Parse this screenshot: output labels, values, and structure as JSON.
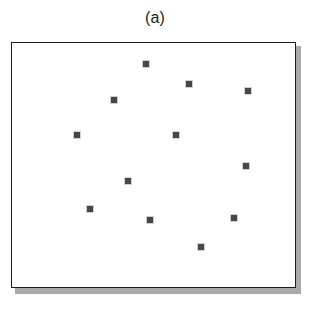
{
  "figure": {
    "caption": "(a)",
    "caption_name": "panel-label-a"
  },
  "colors": {
    "marker_fill": "#474747",
    "plot_border": "#1c1c1c",
    "plot_background": "#ffffff",
    "drop_shadow": "#a9a9a9",
    "caption_text": "#1b1b1b"
  },
  "plot": {
    "left": 11,
    "top": 42,
    "width": 285,
    "height": 246,
    "shadow_offset_x": 4,
    "shadow_offset_y": 4,
    "border_width": 1
  },
  "chart_data": {
    "type": "scatter",
    "title": "(a)",
    "xlabel": "",
    "ylabel": "",
    "grid": false,
    "legend": false,
    "marker": "filled-square",
    "marker_size_px": 6,
    "marker_color": "#474747",
    "n_points": 12,
    "axis_units": "pixels (image coordinates, origin at plot top-left)",
    "xlim": [
      0,
      285
    ],
    "ylim": [
      0,
      246
    ],
    "x": [
      134,
      102,
      177,
      236,
      65,
      164,
      234,
      116,
      78,
      138,
      222,
      189
    ],
    "y": [
      21,
      57,
      41,
      48,
      92,
      92,
      123,
      138,
      166,
      177,
      175,
      204
    ],
    "points": [
      {
        "x": 134,
        "y": 21
      },
      {
        "x": 102,
        "y": 57
      },
      {
        "x": 177,
        "y": 41
      },
      {
        "x": 236,
        "y": 48
      },
      {
        "x": 65,
        "y": 92
      },
      {
        "x": 164,
        "y": 92
      },
      {
        "x": 234,
        "y": 123
      },
      {
        "x": 116,
        "y": 138
      },
      {
        "x": 78,
        "y": 166
      },
      {
        "x": 138,
        "y": 177
      },
      {
        "x": 222,
        "y": 175
      },
      {
        "x": 189,
        "y": 204
      }
    ]
  }
}
